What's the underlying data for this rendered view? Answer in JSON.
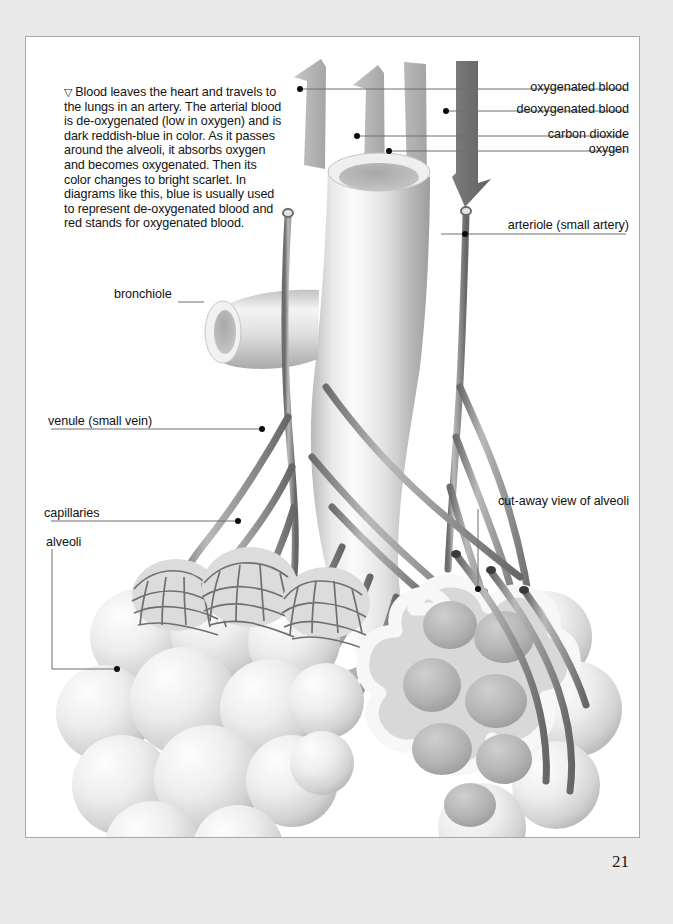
{
  "page": {
    "number": "21",
    "background_color": "#e9e9e9",
    "frame_color": "#ffffff"
  },
  "caption": {
    "marker": "▽",
    "text": "Blood leaves the heart and travels to the lungs in an artery. The arterial blood is de-oxygenated (low in oxygen) and is dark reddish-blue in color. As it passes around the alveoli, it absorbs oxygen and becomes oxygenated. Then its color changes to bright scarlet. In diagrams like this, blue is usually used to represent de-oxygenated blood and red stands for oxygenated blood."
  },
  "labels": {
    "oxygenated_blood": "oxygenated blood",
    "deoxygenated_blood": "deoxygenated blood",
    "carbon_dioxide": "carbon dioxide",
    "oxygen": "oxygen",
    "arteriole": "arteriole (small artery)",
    "cutaway": "cut-away view of alveoli",
    "bronchiole": "bronchiole",
    "venule": "venule (small vein)",
    "capillaries": "capillaries",
    "alveoli": "alveoli"
  },
  "illustration": {
    "subject": "lung bronchiole with alveoli and blood vessels",
    "arrow_count": 4,
    "arrow_labels": [
      "oxygenated blood",
      "deoxygenated blood",
      "carbon dioxide",
      "oxygen"
    ],
    "colors": {
      "vessel": "#8c8c8c",
      "vessel_dark": "#6a6a6a",
      "tissue_light": "#f2f2f2",
      "tissue_mid": "#c9c9c9",
      "tissue_shade": "#a3a3a3",
      "arrow_light": "#b4b4b4",
      "arrow_dark": "#6e6e6e",
      "leader_line": "#6f6f6f"
    }
  }
}
